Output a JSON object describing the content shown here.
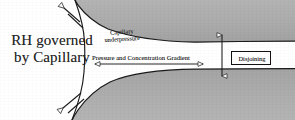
{
  "figure": {
    "title_left": {
      "line1": "RH governed",
      "line2": "by Capillary"
    },
    "labels": {
      "underpressure_line1": "Capillary",
      "underpressure_line2": "underpressure",
      "gradient": "Pressure and Concentration Gradient",
      "disjoining": "Disjoining"
    },
    "colors": {
      "solid_fill": "#adadad",
      "solid_fill_dark": "#9a9a9a",
      "outline": "#1a1a1a",
      "text": "#1d1d1d",
      "background": "#ffffff",
      "box_border": "#111111"
    },
    "icons": {
      "meniscus_arrow_top": "arrow-up-left-icon",
      "meniscus_arrow_bottom": "arrow-down-left-icon",
      "gradient_arrow": "double-headed-horizontal-arrow-icon",
      "gap_arrow": "double-headed-vertical-arrow-icon"
    },
    "geometry": {
      "width": 295,
      "height": 120,
      "gap_arrow_x": 222,
      "gap_arrow_top_y": 33,
      "gap_arrow_bottom_y": 78,
      "gradient_arrow_y": 64,
      "gradient_arrow_x_start": 93,
      "gradient_arrow_x_end": 205
    }
  }
}
